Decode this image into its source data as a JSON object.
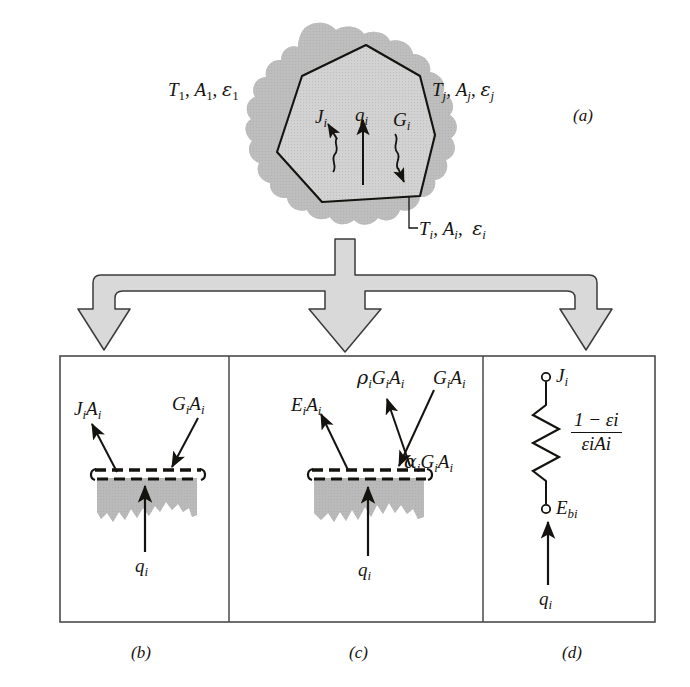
{
  "figure": {
    "panels": [
      {
        "id": "a",
        "letter": "(a)",
        "caption": "(a)"
      },
      {
        "id": "b",
        "letter": "(b)",
        "caption": "(b)"
      },
      {
        "id": "c",
        "letter": "(c)",
        "caption": "(c)"
      },
      {
        "id": "d",
        "letter": "(d)",
        "caption": "(d)"
      }
    ],
    "colors": {
      "line": "#15130f",
      "cloud_fill": "#bdbdbd",
      "enclosure_fill": "#d3d3d3",
      "surface_fill": "#b5b5b5",
      "big_arrow_fill": "#d6d6d6",
      "panel_border": "#4a4a4a",
      "background": "#ffffff"
    }
  },
  "panel_a": {
    "label_left": {
      "t": "T",
      "t_sub": "1",
      "a": "A",
      "a_sub": "1",
      "e": "ε",
      "e_sub": "1",
      "text": "T1, A1, ε1"
    },
    "label_right": {
      "t": "T",
      "t_sub": "j",
      "a": "A",
      "a_sub": "j",
      "e": "ε",
      "e_sub": "j",
      "text": "Tj, Aj, εj"
    },
    "label_surface": {
      "t": "T",
      "t_sub": "i",
      "a": "A",
      "a_sub": "i",
      "e": "ε",
      "e_sub": "i",
      "text": "Ti, Ai, εi"
    },
    "flux_radiosity": {
      "sym": "J",
      "sub": "i",
      "text": "Ji"
    },
    "flux_net": {
      "sym": "q",
      "sub": "i",
      "text": "qi"
    },
    "flux_irradiation": {
      "sym": "G",
      "sub": "i",
      "text": "Gi"
    },
    "letter": "(a)"
  },
  "panel_b": {
    "radiosity": {
      "text": "JiAi",
      "sym1": "J",
      "sub1": "i",
      "sym2": "A",
      "sub2": "i"
    },
    "irradiation": {
      "text": "GiAi",
      "sym1": "G",
      "sub1": "i",
      "sym2": "A",
      "sub2": "i"
    },
    "net_flux": {
      "text": "qi",
      "sym": "q",
      "sub": "i"
    },
    "letter": "(b)"
  },
  "panel_c": {
    "emission": {
      "text": "EiAi",
      "sym1": "E",
      "sub1": "i",
      "sym2": "A",
      "sub2": "i"
    },
    "reflection": {
      "text": "ρiGiAi",
      "sym0": "ρ",
      "sub0": "i",
      "sym1": "G",
      "sub1": "i",
      "sym2": "A",
      "sub2": "i"
    },
    "irradiation": {
      "text": "GiAi",
      "sym1": "G",
      "sub1": "i",
      "sym2": "A",
      "sub2": "i"
    },
    "absorption": {
      "text": "αiGiAi",
      "sym0": "α",
      "sub0": "i",
      "sym1": "G",
      "sub1": "i",
      "sym2": "A",
      "sub2": "i"
    },
    "net_flux": {
      "text": "qi",
      "sym": "q",
      "sub": "i"
    },
    "letter": "(c)"
  },
  "panel_d": {
    "node_top": {
      "text": "Ji",
      "sym": "J",
      "sub": "i"
    },
    "node_bottom": {
      "text": "Ebi",
      "sym": "E",
      "sub": "bi"
    },
    "resistance": {
      "text": "(1 - εi) / (εi Ai)",
      "numerator": "1 − εi",
      "denominator": "εiAi",
      "num_one": "1",
      "num_minus": "−",
      "num_eps": "ε",
      "num_eps_sub": "i",
      "den_eps": "ε",
      "den_eps_sub": "i",
      "den_a": "A",
      "den_a_sub": "i"
    },
    "source_flux": {
      "text": "qi",
      "sym": "q",
      "sub": "i"
    },
    "letter": "(d)"
  }
}
